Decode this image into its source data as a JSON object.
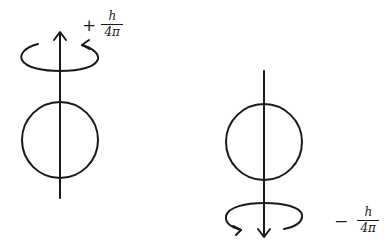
{
  "diagram": {
    "stroke_color": "#1a1a1a",
    "background": "#ffffff",
    "particles": [
      {
        "id": "spin-up",
        "arrow_direction": "up",
        "rotation_direction": "counterclockwise (viewed from above)",
        "label": {
          "sign": "+",
          "numerator": "h",
          "denominator": "4π"
        }
      },
      {
        "id": "spin-down",
        "arrow_direction": "down",
        "rotation_direction": "clockwise (viewed from above)",
        "label": {
          "sign": "−",
          "numerator": "h",
          "denominator": "4π"
        }
      }
    ]
  }
}
